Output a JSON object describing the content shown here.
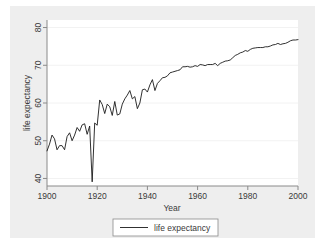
{
  "chart_data": {
    "type": "line",
    "title": "",
    "xlabel": "Year",
    "ylabel": "life expectancy",
    "xlim": [
      1900,
      2000
    ],
    "ylim": [
      38,
      82
    ],
    "xticks": [
      1900,
      1920,
      1940,
      1960,
      1980,
      2000
    ],
    "yticks": [
      40,
      50,
      60,
      70,
      80
    ],
    "grid": true,
    "grid_axis": "y",
    "legend": {
      "position": "bottom-center",
      "entries": [
        {
          "label": "life expectancy",
          "color": "#1a1a1a",
          "style": "line"
        }
      ]
    },
    "series": [
      {
        "name": "life expectancy",
        "color": "#1a1a1a",
        "x": [
          1900,
          1901,
          1902,
          1903,
          1904,
          1905,
          1906,
          1907,
          1908,
          1909,
          1910,
          1911,
          1912,
          1913,
          1914,
          1915,
          1916,
          1917,
          1918,
          1919,
          1920,
          1921,
          1922,
          1923,
          1924,
          1925,
          1926,
          1927,
          1928,
          1929,
          1930,
          1931,
          1932,
          1933,
          1934,
          1935,
          1936,
          1937,
          1938,
          1939,
          1940,
          1941,
          1942,
          1943,
          1944,
          1945,
          1946,
          1947,
          1948,
          1949,
          1950,
          1951,
          1952,
          1953,
          1954,
          1955,
          1956,
          1957,
          1958,
          1959,
          1960,
          1961,
          1962,
          1963,
          1964,
          1965,
          1966,
          1967,
          1968,
          1969,
          1970,
          1971,
          1972,
          1973,
          1974,
          1975,
          1976,
          1977,
          1978,
          1979,
          1980,
          1981,
          1982,
          1983,
          1984,
          1985,
          1986,
          1987,
          1988,
          1989,
          1990,
          1991,
          1992,
          1993,
          1994,
          1995,
          1996,
          1997,
          1998,
          1999,
          2000
        ],
        "y": [
          47.3,
          49.1,
          51.5,
          50.5,
          47.6,
          48.7,
          48.7,
          47.6,
          51.1,
          52.1,
          50.0,
          51.5,
          53.5,
          52.5,
          54.2,
          54.5,
          51.7,
          53.9,
          39.1,
          54.7,
          54.1,
          60.8,
          59.6,
          57.2,
          59.7,
          59.0,
          56.7,
          60.4,
          56.8,
          57.1,
          59.7,
          61.1,
          62.1,
          63.3,
          61.1,
          61.7,
          58.5,
          60.0,
          63.5,
          63.7,
          62.9,
          64.8,
          66.2,
          63.3,
          65.2,
          65.9,
          66.7,
          66.8,
          67.2,
          68.0,
          68.2,
          68.4,
          68.6,
          68.8,
          69.6,
          69.6,
          69.7,
          69.5,
          69.6,
          69.9,
          69.7,
          70.2,
          70.1,
          69.9,
          70.2,
          70.2,
          70.2,
          70.5,
          69.9,
          70.5,
          70.8,
          71.1,
          71.2,
          71.4,
          72.0,
          72.6,
          72.9,
          73.3,
          73.5,
          73.9,
          73.7,
          74.2,
          74.5,
          74.6,
          74.7,
          74.7,
          74.7,
          74.9,
          74.9,
          75.1,
          75.4,
          75.5,
          75.8,
          75.5,
          75.7,
          75.8,
          76.1,
          76.5,
          76.7,
          76.7,
          76.8
        ]
      }
    ],
    "annotations": [
      {
        "label": "1918 influenza pandemic trough",
        "x": 1918,
        "y": 39.1
      }
    ]
  },
  "axes": {
    "x_tick_labels": [
      "1900",
      "1920",
      "1940",
      "1960",
      "1980",
      "2000"
    ],
    "y_tick_labels": [
      "40",
      "50",
      "60",
      "70",
      "80"
    ],
    "x_title": "Year",
    "y_title": "life expectancy"
  },
  "legend": {
    "entry_label": "life expectancy"
  },
  "colors": {
    "line": "#1a1a1a",
    "axis": "#8a8a8a",
    "grid": "#f2f2f2",
    "panel_background": "#eeeeee",
    "plot_background": "#ffffff",
    "text": "#3a3a3a"
  }
}
